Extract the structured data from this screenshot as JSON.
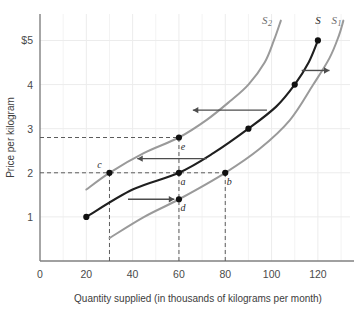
{
  "chart_data": {
    "type": "line",
    "title": "",
    "xlabel": "Quantity supplied (in thousands of kilograms per month)",
    "ylabel": "Price per kilogram",
    "xlim": [
      0,
      133
    ],
    "ylim": [
      0,
      5.6
    ],
    "grid": true,
    "legend_position": "inline-curve-end-labels",
    "xticks": [
      {
        "value": 0,
        "label": "0"
      },
      {
        "value": 20,
        "label": "20"
      },
      {
        "value": 40,
        "label": "40"
      },
      {
        "value": 60,
        "label": "60"
      },
      {
        "value": 80,
        "label": "80"
      },
      {
        "value": 100,
        "label": "100"
      },
      {
        "value": 120,
        "label": "120"
      }
    ],
    "yticks": [
      {
        "value": 1,
        "label": "1"
      },
      {
        "value": 2,
        "label": "2"
      },
      {
        "value": 3,
        "label": "3"
      },
      {
        "value": 4,
        "label": "4"
      },
      {
        "value": 5,
        "label": "$5"
      }
    ],
    "series": [
      {
        "name": "S",
        "label": "S",
        "label_sub": "",
        "role": "original-supply",
        "color": "#1f1f1f",
        "width": 2.1,
        "label_x": 120,
        "label_y": 5.38,
        "points": [
          {
            "x": 20,
            "y": 1.0
          },
          {
            "x": 40,
            "y": 1.62
          },
          {
            "x": 60,
            "y": 2.0
          },
          {
            "x": 75,
            "y": 2.45
          },
          {
            "x": 90,
            "y": 3.0
          },
          {
            "x": 102,
            "y": 3.5
          },
          {
            "x": 110,
            "y": 4.0
          },
          {
            "x": 116,
            "y": 4.5
          },
          {
            "x": 120,
            "y": 5.0
          }
        ]
      },
      {
        "name": "S2",
        "label": "S",
        "label_sub": "2",
        "role": "decreased-supply",
        "color": "#9a9a9a",
        "width": 2.0,
        "label_x": 98,
        "label_y": 5.38,
        "points": [
          {
            "x": 20,
            "y": 1.62
          },
          {
            "x": 30,
            "y": 2.0
          },
          {
            "x": 45,
            "y": 2.45
          },
          {
            "x": 60,
            "y": 2.8
          },
          {
            "x": 72,
            "y": 3.2
          },
          {
            "x": 82,
            "y": 3.62
          },
          {
            "x": 90,
            "y": 4.0
          },
          {
            "x": 97,
            "y": 4.5
          },
          {
            "x": 101,
            "y": 5.0
          },
          {
            "x": 104,
            "y": 5.45
          }
        ]
      },
      {
        "name": "S1",
        "label": "S",
        "label_sub": "1",
        "role": "increased-supply",
        "color": "#9a9a9a",
        "width": 2.0,
        "label_x": 128,
        "label_y": 5.38,
        "points": [
          {
            "x": 30,
            "y": 0.52
          },
          {
            "x": 45,
            "y": 1.0
          },
          {
            "x": 60,
            "y": 1.4
          },
          {
            "x": 80,
            "y": 2.0
          },
          {
            "x": 95,
            "y": 2.55
          },
          {
            "x": 108,
            "y": 3.2
          },
          {
            "x": 118,
            "y": 4.0
          },
          {
            "x": 125,
            "y": 4.6
          },
          {
            "x": 129,
            "y": 5.1
          },
          {
            "x": 131,
            "y": 5.45
          }
        ]
      }
    ],
    "points": [
      {
        "id": "origin-s",
        "label": "",
        "x": 20,
        "y": 1.0,
        "curve": "S",
        "label_dx": 0,
        "label_dy": 0
      },
      {
        "id": "a",
        "label": "a",
        "x": 60,
        "y": 2.0,
        "curve": "S",
        "label_dx": 4,
        "label_dy": 12
      },
      {
        "id": "b",
        "label": "b",
        "x": 80,
        "y": 2.0,
        "curve": "S1",
        "label_dx": 4,
        "label_dy": 12
      },
      {
        "id": "c",
        "label": "c",
        "x": 30,
        "y": 2.0,
        "curve": "S2",
        "label_dx": -10,
        "label_dy": -5
      },
      {
        "id": "d",
        "label": "d",
        "x": 60,
        "y": 1.4,
        "curve": "S1",
        "label_dx": 4,
        "label_dy": 12
      },
      {
        "id": "e",
        "label": "e",
        "x": 60,
        "y": 2.8,
        "curve": "S2",
        "label_dx": 4,
        "label_dy": 12
      },
      {
        "id": "s-90",
        "label": "",
        "x": 90,
        "y": 3.0,
        "curve": "S",
        "label_dx": 0,
        "label_dy": 0
      },
      {
        "id": "s-110",
        "label": "",
        "x": 110,
        "y": 4.0,
        "curve": "S",
        "label_dx": 0,
        "label_dy": 0
      },
      {
        "id": "s-120",
        "label": "",
        "x": 120,
        "y": 5.0,
        "curve": "S",
        "label_dx": 0,
        "label_dy": 0
      }
    ],
    "dashed_guides": [
      {
        "id": "price-2-horizontal",
        "orientation": "horizontal",
        "value": 2.0,
        "from": 0,
        "to": 80
      },
      {
        "id": "price-2p8-horizontal",
        "orientation": "horizontal",
        "value": 2.8,
        "from": 0,
        "to": 60
      },
      {
        "id": "qty-30-vertical",
        "orientation": "vertical",
        "value": 30,
        "from": 0,
        "to": 2.0
      },
      {
        "id": "qty-60-vertical",
        "orientation": "vertical",
        "value": 60,
        "from": 0,
        "to": 2.8
      },
      {
        "id": "qty-80-vertical",
        "orientation": "vertical",
        "value": 80,
        "from": 0,
        "to": 2.0
      }
    ],
    "arrows": [
      {
        "id": "arrow-increase-supply-low",
        "direction": "right",
        "x_start": 38,
        "x_end": 58,
        "y": 1.4
      },
      {
        "id": "arrow-decrease-supply-mid",
        "direction": "left",
        "x_start": 72,
        "x_end": 42,
        "y": 2.32
      },
      {
        "id": "arrow-decrease-supply-high",
        "direction": "left",
        "x_start": 98,
        "x_end": 66,
        "y": 3.42
      },
      {
        "id": "arrow-increase-supply-high",
        "direction": "right",
        "x_start": 113,
        "x_end": 125,
        "y": 4.32
      }
    ],
    "annotations": []
  }
}
